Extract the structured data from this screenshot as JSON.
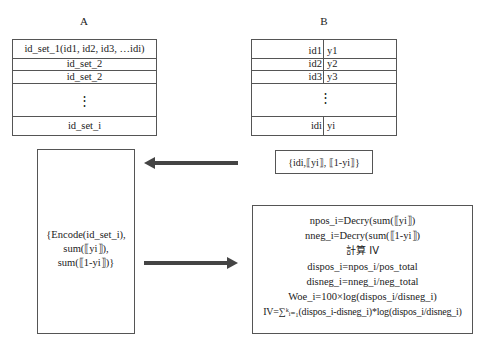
{
  "party_a": {
    "label": "A",
    "rows": [
      "id_set_1(id1, id2, id3, …idi)",
      "id_set_2",
      "id_set_2",
      "⋮",
      "id_set_i"
    ]
  },
  "party_b": {
    "label": "B",
    "rows": [
      {
        "id": "id1",
        "y": "y1"
      },
      {
        "id": "id2",
        "y": "y2"
      },
      {
        "id": "id3",
        "y": "y3"
      },
      {
        "id": "⋮",
        "y": ""
      },
      {
        "id": "idi",
        "y": "yi"
      }
    ]
  },
  "encrypted_labels_box": {
    "text": "{idi,⟦yi⟧, ⟦1-yi⟧}"
  },
  "encode_box": {
    "lines": [
      "{Encode(id_set_i),",
      "sum(⟦yi⟧),",
      "sum(⟦1-yi⟧)}"
    ]
  },
  "compute_box": {
    "lines": [
      "npos_i=Decry(sum(⟦yi⟧)",
      "nneg_i=Decry(sum(⟦1-yi⟧)",
      "計算 IV",
      "dispos_i=npos_i/pos_total",
      "disneg_i=nneg_i/neg_total",
      "Woe_i=100×log(dispos_i/disneg_i)",
      "IV=∑ᵏᵢ₌₁(dispos_i-disneg_i)*log(dispos_i/disneg_i)"
    ]
  },
  "arrows": {
    "b_to_a": {
      "direction": "left",
      "from": "encrypted-labels-box",
      "to": "encode-box"
    },
    "a_to_b": {
      "direction": "right",
      "from": "encode-box",
      "to": "compute-box"
    }
  }
}
